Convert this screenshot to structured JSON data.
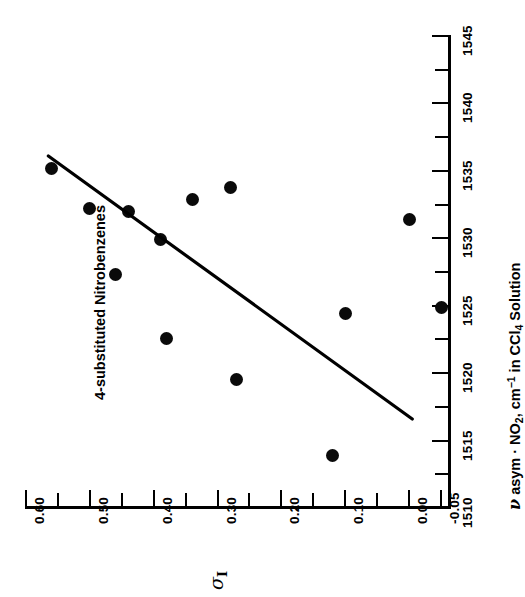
{
  "figure": {
    "annotation": "4-substituted Nitrobenzenes",
    "rotation_note": "all text rotated -90 degrees",
    "marker_color": "#0a0a0a",
    "axis_color": "#000000",
    "background": "#ffffff"
  },
  "chart_data": {
    "type": "scatter",
    "title": "",
    "annotation": "4-substituted Nitrobenzenes",
    "xlabel": "ν asym · NO2, cm-1 in CCl4 Solution",
    "xlabel_parts": {
      "symbol": "ν",
      "text1": " asym · NO",
      "sub1": "2",
      "text2": ", cm",
      "sup1": "-1",
      "text3": " in CCl",
      "sub2": "4",
      "text4": " Solution"
    },
    "ylabel": "σI",
    "ylabel_parts": {
      "symbol": "σ",
      "sub": "I"
    },
    "xlim": [
      1510,
      1546
    ],
    "ylim": [
      -0.05,
      0.625
    ],
    "xticks": [
      1510,
      1515,
      1520,
      1525,
      1530,
      1535,
      1540,
      1545
    ],
    "xtick_labels": [
      "1510",
      "1515",
      "1520",
      "1525",
      "1530",
      "1535",
      "1540",
      "1545"
    ],
    "xticks_minor": [
      1512.5,
      1517.5,
      1522.5,
      1527.5,
      1532.5,
      1537.5,
      1542.5
    ],
    "yticks": [
      0.6,
      0.5,
      0.4,
      0.3,
      0.2,
      0.1,
      0.0,
      -0.05
    ],
    "ytick_labels": [
      "0.60",
      "0.50",
      "0.40",
      "0.30",
      "0.20",
      "0.10",
      "0.00",
      "-0.05"
    ],
    "yticks_minor": [
      0.55,
      0.45,
      0.35,
      0.25,
      0.15,
      0.05
    ],
    "grid": false,
    "legend": false,
    "points": [
      {
        "x": 1535.2,
        "y": 0.56
      },
      {
        "x": 1532.2,
        "y": 0.5
      },
      {
        "x": 1532.0,
        "y": 0.44
      },
      {
        "x": 1527.3,
        "y": 0.46
      },
      {
        "x": 1529.9,
        "y": 0.39
      },
      {
        "x": 1532.9,
        "y": 0.34
      },
      {
        "x": 1533.8,
        "y": 0.28
      },
      {
        "x": 1522.6,
        "y": 0.38
      },
      {
        "x": 1519.5,
        "y": 0.27
      },
      {
        "x": 1524.4,
        "y": 0.1
      },
      {
        "x": 1531.4,
        "y": 0.0
      },
      {
        "x": 1524.9,
        "y": -0.05
      },
      {
        "x": 1513.9,
        "y": 0.12
      }
    ],
    "trendline": {
      "x0": 1536.1,
      "y0": 0.565,
      "x1": 1516.6,
      "y1": -0.005
    }
  }
}
